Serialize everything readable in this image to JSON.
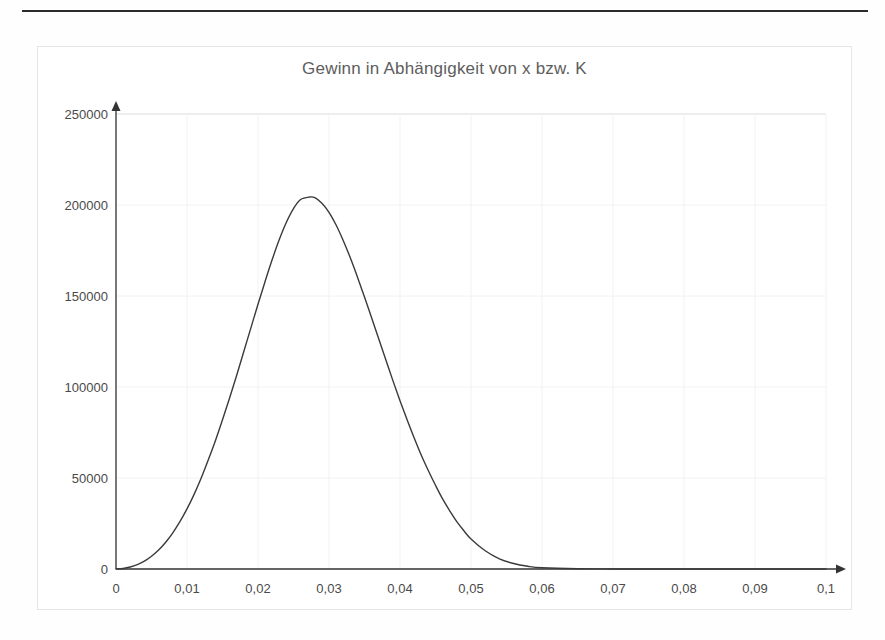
{
  "page": {
    "background_color": "#fefefe",
    "rule_color": "#2b2b2b"
  },
  "chart_frame": {
    "border_color": "#e6e6e6"
  },
  "chart_data": {
    "type": "line",
    "title": "Gewinn in Abhängigkeit von x bzw. K",
    "xlabel": "",
    "ylabel": "",
    "xlim": [
      0,
      0.1
    ],
    "ylim": [
      0,
      250000
    ],
    "grid": true,
    "grid_color": "#f2f2f2",
    "legend": null,
    "legend_position": "none",
    "line_color": "#3a3a3a",
    "line_width": 1.4,
    "axis_color": "#333333",
    "axis_arrows": true,
    "xticks": [
      0,
      0.01,
      0.02,
      0.03,
      0.04,
      0.05,
      0.06,
      0.07,
      0.08,
      0.09,
      0.1
    ],
    "xtick_labels": [
      "0",
      "0,01",
      "0,02",
      "0,03",
      "0,04",
      "0,05",
      "0,06",
      "0,07",
      "0,08",
      "0,09",
      "0,1"
    ],
    "yticks": [
      0,
      50000,
      100000,
      150000,
      200000,
      250000
    ],
    "ytick_labels": [
      "0",
      "50000",
      "100000",
      "150000",
      "200000",
      "250000"
    ],
    "peak": {
      "x": 0.0273,
      "y": 204400
    },
    "series": [
      {
        "name": "Gewinn",
        "x": [
          0.0,
          0.001,
          0.002,
          0.003,
          0.004,
          0.005,
          0.006,
          0.007,
          0.008,
          0.009,
          0.01,
          0.011,
          0.012,
          0.013,
          0.014,
          0.015,
          0.016,
          0.017,
          0.018,
          0.019,
          0.02,
          0.021,
          0.022,
          0.023,
          0.024,
          0.025,
          0.026,
          0.0273,
          0.028,
          0.029,
          0.03,
          0.031,
          0.032,
          0.033,
          0.034,
          0.035,
          0.036,
          0.037,
          0.038,
          0.039,
          0.04,
          0.041,
          0.042,
          0.043,
          0.044,
          0.045,
          0.046,
          0.047,
          0.048,
          0.049,
          0.05,
          0.052,
          0.054,
          0.056,
          0.058,
          0.06,
          0.065,
          0.07,
          0.075,
          0.08,
          0.085,
          0.09,
          0.095,
          0.1
        ],
        "y": [
          0,
          300,
          1100,
          2400,
          4300,
          7000,
          10400,
          14700,
          19900,
          26000,
          33000,
          41000,
          50000,
          60000,
          70500,
          82000,
          94000,
          106500,
          119500,
          132500,
          145500,
          158000,
          170000,
          181000,
          190500,
          198000,
          203000,
          204400,
          204000,
          201000,
          196000,
          189000,
          180500,
          171000,
          160500,
          149500,
          138000,
          126500,
          115000,
          103500,
          92500,
          82000,
          72000,
          62500,
          54000,
          46000,
          38500,
          32000,
          26000,
          21000,
          16500,
          10000,
          5600,
          3000,
          1500,
          700,
          150,
          40,
          10,
          4,
          2,
          1,
          0,
          0
        ]
      }
    ]
  },
  "axis_geometry": {
    "origin_x_px": 78,
    "origin_y_px": 522,
    "x_unit_px": 71,
    "y_50k_px": 91
  }
}
